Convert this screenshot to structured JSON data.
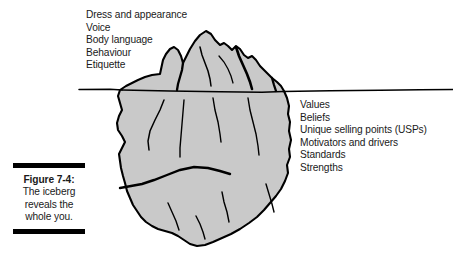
{
  "figure": {
    "number_label": "Figure 7-4:",
    "description_lines": [
      "The iceberg",
      "reveals the",
      "whole you."
    ],
    "description_text": "The iceberg reveals the whole you."
  },
  "diagram": {
    "title_implied": "The iceberg reveals the whole you.",
    "type": "iceberg-metaphor",
    "waterline_label": "",
    "ice_fill_color": "#c9c9c9",
    "outline_color": "#000000",
    "background_color": "#ffffff",
    "text_color": "#1a1a1a"
  },
  "visible_traits": {
    "region": "above-waterline",
    "items": [
      "Dress and appearance",
      "Voice",
      "Body language",
      "Behaviour",
      "Etiquette"
    ]
  },
  "hidden_traits": {
    "region": "below-waterline",
    "items": [
      "Values",
      "Beliefs",
      "Unique selling points (USPs)",
      "Motivators and drivers",
      "Standards",
      "Strengths"
    ]
  }
}
